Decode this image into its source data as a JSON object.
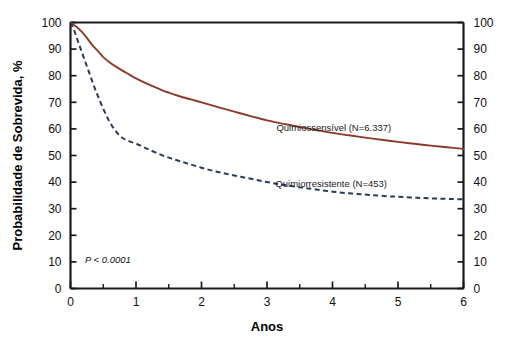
{
  "chart_data": {
    "type": "line",
    "title": "",
    "xlabel": "Anos",
    "ylabel": "Probabilidade de Sobrevida, %",
    "xlim": [
      0,
      6
    ],
    "ylim": [
      0,
      100
    ],
    "grid": false,
    "legend_position": "inline-right",
    "x_ticks": [
      "0",
      "1",
      "2",
      "3",
      "4",
      "5",
      "6"
    ],
    "x_tick_values": [
      0,
      1,
      2,
      3,
      4,
      5,
      6
    ],
    "x_minor_tick_values": [
      0.5,
      1.5,
      2.5,
      3.5,
      4.5,
      5.5
    ],
    "y_ticks": [
      "0",
      "10",
      "20",
      "30",
      "40",
      "50",
      "60",
      "70",
      "80",
      "90",
      "100"
    ],
    "y_tick_values": [
      0,
      10,
      20,
      30,
      40,
      50,
      60,
      70,
      80,
      90,
      100
    ],
    "y_ticks_right": [
      "0",
      "10",
      "20",
      "30",
      "40",
      "50",
      "60",
      "70",
      "80",
      "90",
      "100"
    ],
    "annotations": [
      {
        "name": "p-value",
        "text": "P < 0.0001",
        "x": 0.22,
        "y": 9.5
      }
    ],
    "series": [
      {
        "name": "Quimiossensível (N=6.337)",
        "label": "Quimiossensível (N=6.337)",
        "style": "solid",
        "color": "#8B3A2A",
        "label_x": 4.02,
        "label_y": 60.5,
        "x": [
          0,
          0.08,
          0.17,
          0.25,
          0.33,
          0.42,
          0.5,
          0.6,
          0.7,
          0.8,
          0.9,
          1.0,
          1.15,
          1.3,
          1.5,
          1.7,
          1.85,
          2.0,
          2.25,
          2.5,
          2.75,
          3.0,
          3.25,
          3.5,
          3.75,
          4.0,
          4.25,
          4.5,
          4.75,
          5.0,
          5.25,
          5.5,
          5.75,
          6.0
        ],
        "y": [
          100,
          98.6,
          96.6,
          94.2,
          91.6,
          89.2,
          87.0,
          85.0,
          83.3,
          81.8,
          80.4,
          79.0,
          77.2,
          75.6,
          73.6,
          72.0,
          71.0,
          70.0,
          68.2,
          66.5,
          64.8,
          63.2,
          61.9,
          60.7,
          59.6,
          58.5,
          57.6,
          56.7,
          55.9,
          55.1,
          54.4,
          53.7,
          53.1,
          52.5
        ]
      },
      {
        "name": "Quimiorresistente (N=453)",
        "label": "Quimiorresistente (N=453)",
        "style": "dashed",
        "color": "#2B3A5C",
        "label_x": 3.98,
        "label_y": 39.5,
        "x": [
          0,
          0.06,
          0.12,
          0.2,
          0.28,
          0.36,
          0.44,
          0.52,
          0.6,
          0.68,
          0.75,
          0.82,
          0.9,
          1.0,
          1.1,
          1.2,
          1.35,
          1.5,
          1.65,
          1.8,
          2.0,
          2.2,
          2.4,
          2.6,
          2.8,
          3.0,
          3.2,
          3.45,
          3.7,
          4.0,
          4.3,
          4.6,
          4.9,
          5.0,
          5.3,
          5.6,
          5.85,
          6.0
        ],
        "y": [
          100,
          96.8,
          92.5,
          87.0,
          81.5,
          76.0,
          71.0,
          66.5,
          62.5,
          59.5,
          57.5,
          56.2,
          55.3,
          54.5,
          53.3,
          52.2,
          50.6,
          49.2,
          48.0,
          46.9,
          45.4,
          44.1,
          43.0,
          42.0,
          41.0,
          40.0,
          39.2,
          38.2,
          37.4,
          36.4,
          35.7,
          35.1,
          34.6,
          34.5,
          34.1,
          33.8,
          33.6,
          33.5
        ]
      }
    ]
  }
}
